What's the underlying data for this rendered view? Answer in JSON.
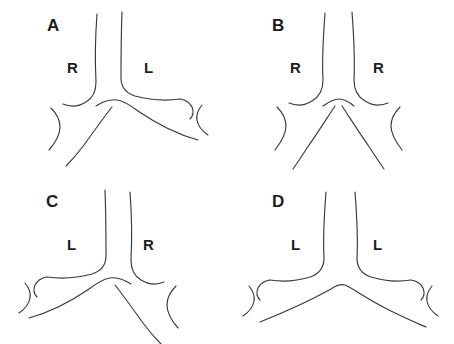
{
  "figure": {
    "background_color": "#ffffff",
    "stroke_color": "#3a3a3a",
    "text_color": "#1d1d1d",
    "width": 454,
    "height": 344
  },
  "panels": [
    {
      "id": "a",
      "label": "A",
      "label_x": 47,
      "label_y": 17,
      "side_labels": [
        {
          "text": "R",
          "x": 67,
          "y": 60
        },
        {
          "text": "L",
          "x": 144,
          "y": 60
        }
      ]
    },
    {
      "id": "b",
      "label": "B",
      "label_x": 45,
      "label_y": 17,
      "side_labels": [
        {
          "text": "R",
          "x": 63,
          "y": 60
        },
        {
          "text": "R",
          "x": 146,
          "y": 60
        }
      ]
    },
    {
      "id": "c",
      "label": "C",
      "label_x": 46,
      "label_y": 21,
      "side_labels": [
        {
          "text": "L",
          "x": 67,
          "y": 65
        },
        {
          "text": "R",
          "x": 143,
          "y": 65
        }
      ]
    },
    {
      "id": "d",
      "label": "D",
      "label_x": 45,
      "label_y": 21,
      "side_labels": [
        {
          "text": "L",
          "x": 64,
          "y": 65
        },
        {
          "text": "L",
          "x": 146,
          "y": 65
        }
      ]
    }
  ]
}
